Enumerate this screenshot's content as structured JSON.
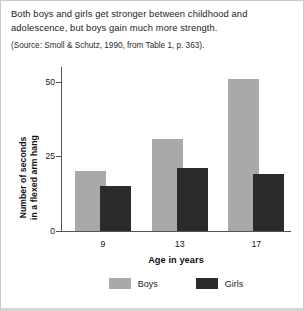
{
  "caption": {
    "main": "Both boys and girls get stronger between childhood and adolescence, but boys gain much more strength.",
    "source": "(Source: Smoll & Schutz, 1990, from Table 1, p. 363)."
  },
  "chart_data": {
    "type": "bar",
    "title": "",
    "xlabel": "Age in years",
    "ylabel_line1": "Number of seconds",
    "ylabel_line2": "in a flexed arm hang",
    "categories": [
      "9",
      "13",
      "17"
    ],
    "series": [
      {
        "name": "Boys",
        "color": "#a9a9a9",
        "values": [
          20,
          31,
          51
        ]
      },
      {
        "name": "Girls",
        "color": "#2b2b2b",
        "values": [
          15,
          21,
          19
        ]
      }
    ],
    "ylim": [
      0,
      55
    ],
    "yticks": [
      0,
      25,
      50
    ],
    "ytick_labels": [
      "0",
      "25",
      "50"
    ],
    "grid": false,
    "legend_position": "bottom"
  }
}
